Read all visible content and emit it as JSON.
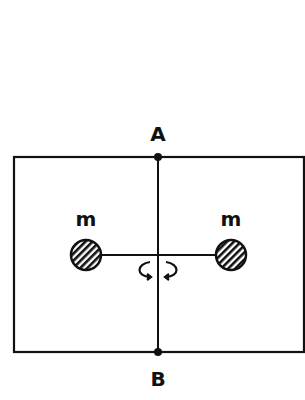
{
  "diagram": {
    "title": "",
    "labels": {
      "top_point": "A",
      "bottom_point": "B",
      "left_mass": "m",
      "right_mass": "m"
    },
    "elements": {
      "frame": "rectangular frame",
      "axis": "vertical rotation axis AB",
      "rod": "horizontal rod connecting two masses",
      "rotation_indicator": "curved arrow indicating rotation about AB"
    },
    "colors": {
      "ink": "#111111",
      "background": "#ffffff"
    }
  }
}
